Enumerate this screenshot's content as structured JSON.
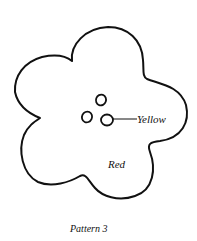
{
  "diagram": {
    "title": "Pattern 3",
    "labels": {
      "center": "Yellow",
      "petals": "Red"
    },
    "colors": {
      "outline": "#111111",
      "background": "#ffffff"
    },
    "center_dots": 3
  }
}
